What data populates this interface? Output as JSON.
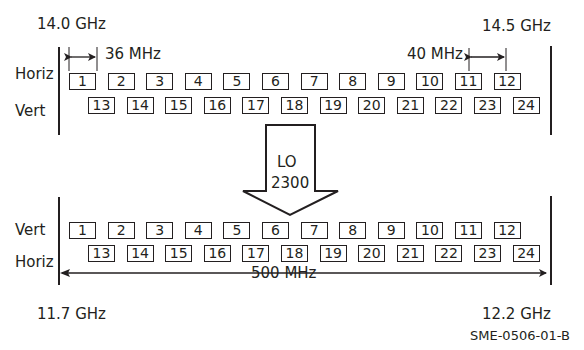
{
  "top": {
    "freq_left": "14.0 GHz",
    "freq_right": "14.5 GHz",
    "row1_label": "Horiz",
    "row2_label": "Vert",
    "bandwidth_label": "36 MHz",
    "spacing_label": "40 MHz",
    "row1_channels": [
      "1",
      "2",
      "3",
      "4",
      "5",
      "6",
      "7",
      "8",
      "9",
      "10",
      "11",
      "12"
    ],
    "row2_channels": [
      "13",
      "14",
      "15",
      "16",
      "17",
      "18",
      "19",
      "20",
      "21",
      "22",
      "23",
      "24"
    ]
  },
  "converter": {
    "line1": "LO",
    "line2": "2300"
  },
  "bottom": {
    "freq_left": "11.7 GHz",
    "freq_right": "12.2 GHz",
    "row1_label": "Vert",
    "row2_label": "Horiz",
    "span_label": "500 MHz",
    "row1_channels": [
      "1",
      "2",
      "3",
      "4",
      "5",
      "6",
      "7",
      "8",
      "9",
      "10",
      "11",
      "12"
    ],
    "row2_channels": [
      "13",
      "14",
      "15",
      "16",
      "17",
      "18",
      "19",
      "20",
      "21",
      "22",
      "23",
      "24"
    ]
  },
  "figure_id": "SME-0506-01-B",
  "colors": {
    "ink": "#231f20",
    "background": "#ffffff"
  }
}
